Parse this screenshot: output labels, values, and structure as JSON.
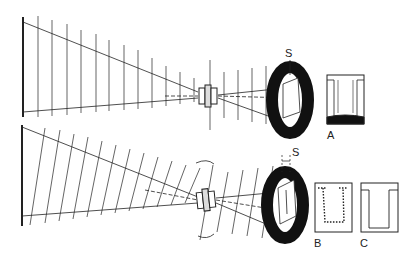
{
  "diagram": {
    "type": "optical projection schematic",
    "panels": [
      {
        "id": "top",
        "description": "Projection from screen through lens to ring aperture, upright rectilinear grid",
        "labels": {
          "aperture": "S",
          "inset": "A"
        }
      },
      {
        "id": "bottom",
        "description": "Same projection with tilted lens (rotation arrows) and skewed grid",
        "labels": {
          "aperture": "S",
          "inset_b": "B",
          "inset_c": "C"
        }
      }
    ]
  },
  "labels": {
    "s_top": "S",
    "s_bottom": "S",
    "a": "A",
    "b": "B",
    "c": "C"
  },
  "colors": {
    "ink": "#111111",
    "background": "#ffffff"
  }
}
